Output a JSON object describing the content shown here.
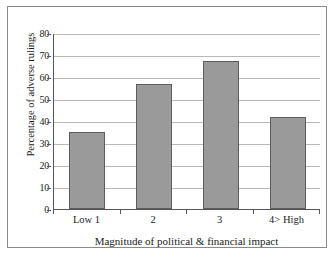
{
  "chart_data": {
    "type": "bar",
    "title": "",
    "xlabel": "Magnitude of political & financial impact",
    "ylabel": "Percentage of adverse rulings",
    "categories": [
      "Low 1",
      "2",
      "3",
      "4>  High"
    ],
    "values": [
      35,
      57,
      67.5,
      42
    ],
    "ylim": [
      0,
      80
    ],
    "ytick_step": 10,
    "yticks": [
      "80",
      "70",
      "60",
      "50",
      "40",
      "30",
      "20",
      "10",
      "0"
    ],
    "ytick_values": [
      80,
      70,
      60,
      50,
      40,
      30,
      20,
      10,
      0
    ],
    "grid": "horizontal",
    "legend": "none",
    "series": [
      {
        "name": "Percentage of adverse rulings",
        "values": [
          35,
          57,
          67.5,
          42
        ]
      }
    ],
    "bar_color": "#9a9a9a",
    "bar_border_color": "#5d5d5d",
    "gridline_color": "#b9b9b9",
    "axis_color": "#555555",
    "frame_color": "#8a8a8a",
    "background_color": "#ffffff"
  }
}
